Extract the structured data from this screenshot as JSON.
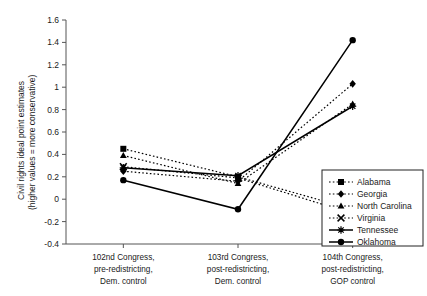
{
  "chart_data": {
    "type": "line",
    "title": "",
    "xlabel": "",
    "ylabel": "Civil rights ideal point estimates (higher values = more conservative)",
    "ylabel_line1": "Civil rights ideal point estimates",
    "ylabel_line2": "(higher values = more conservative)",
    "categories": [
      "102nd Congress, pre-redistricting, Dem. control",
      "103rd Congress, post-redistricting, Dem. control",
      "104th Congress, post-redistricting, GOP control"
    ],
    "category_lines": [
      [
        "102nd Congress,",
        "pre-redistricting,",
        "Dem. control"
      ],
      [
        "103rd Congress,",
        "post-redistricting,",
        "Dem. control"
      ],
      [
        "104th Congress,",
        "post-redistricting,",
        "GOP control"
      ]
    ],
    "ylim": [
      -0.4,
      1.6
    ],
    "yticks": [
      -0.4,
      -0.2,
      0,
      0.2,
      0.4,
      0.6,
      0.8,
      1,
      1.2,
      1.4,
      1.6
    ],
    "ytick_labels": [
      "-0.4",
      "-0.2",
      "0",
      "0.2",
      "0.4",
      "0.6",
      "0.8",
      "1",
      "1.2",
      "1.4",
      "1.6"
    ],
    "grid": false,
    "legend_position": "bottom-right",
    "series": [
      {
        "name": "Alabama",
        "values": [
          0.45,
          0.2,
          -0.09
        ],
        "style": "dotted",
        "marker": "square",
        "color": "#000000"
      },
      {
        "name": "Georgia",
        "values": [
          0.25,
          0.16,
          1.03
        ],
        "style": "dotted",
        "marker": "diamond",
        "color": "#000000"
      },
      {
        "name": "North Carolina",
        "values": [
          0.39,
          0.14,
          0.85
        ],
        "style": "dotted",
        "marker": "triangle",
        "color": "#000000"
      },
      {
        "name": "Virginia",
        "values": [
          0.29,
          0.19,
          -0.13
        ],
        "style": "dotted",
        "marker": "cross",
        "color": "#000000"
      },
      {
        "name": "Tennessee",
        "values": [
          0.28,
          0.21,
          0.83
        ],
        "style": "solid",
        "marker": "star",
        "color": "#000000"
      },
      {
        "name": "Oklahoma",
        "values": [
          0.17,
          -0.09,
          1.42
        ],
        "style": "solid",
        "marker": "circle",
        "color": "#000000"
      }
    ]
  },
  "legend": {
    "entries": [
      "Alabama",
      "Georgia",
      "North Carolina",
      "Virginia",
      "Tennessee",
      "Oklahoma"
    ]
  },
  "colors": {
    "axis": "#555555",
    "series": "#000000",
    "background": "#ffffff"
  }
}
